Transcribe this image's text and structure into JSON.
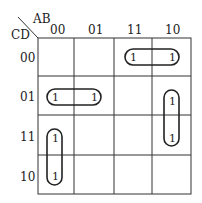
{
  "kmap": {
    "row_var": "CD",
    "col_var": "AB",
    "col_labels": [
      "00",
      "01",
      "11",
      "10"
    ],
    "row_labels": [
      "00",
      "01",
      "11",
      "10"
    ],
    "cells": [
      [
        "",
        "",
        "1",
        "1"
      ],
      [
        "1",
        "1",
        "",
        "1"
      ],
      [
        "1",
        "",
        "",
        "1"
      ],
      [
        "1",
        "",
        "",
        ""
      ]
    ],
    "groups": [
      {
        "cells": [
          [
            0,
            2
          ],
          [
            0,
            3
          ]
        ]
      },
      {
        "cells": [
          [
            1,
            0
          ],
          [
            1,
            1
          ]
        ]
      },
      {
        "cells": [
          [
            1,
            3
          ],
          [
            2,
            3
          ]
        ]
      },
      {
        "cells": [
          [
            2,
            0
          ],
          [
            3,
            0
          ]
        ]
      }
    ]
  },
  "one": "1"
}
